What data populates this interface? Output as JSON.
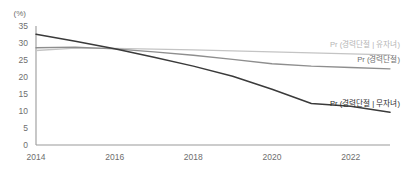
{
  "chart_data": {
    "type": "line",
    "title": "",
    "subtitle": "",
    "xlabel": "",
    "ylabel": "",
    "unit_label": "(%)",
    "grid": false,
    "legend_position": "inline-right-of-line-ends",
    "xlim": [
      2014,
      2023
    ],
    "ylim": [
      0,
      35
    ],
    "yticks": [
      "0",
      "5",
      "10",
      "15",
      "20",
      "25",
      "30",
      "35"
    ],
    "ytick_values": [
      0,
      5,
      10,
      15,
      20,
      25,
      30,
      35
    ],
    "xticks": [
      "2014",
      "2016",
      "2018",
      "2020",
      "2022"
    ],
    "xtick_values": [
      2014,
      2016,
      2018,
      2020,
      2022
    ],
    "x": [
      2014,
      2015,
      2016,
      2017,
      2018,
      2019,
      2020,
      2021,
      2022,
      2023
    ],
    "series": [
      {
        "name": "Pr (경력단절 | 유자녀)",
        "color": "#c4c4c4",
        "label_color": "#b4b4b4",
        "values": [
          27.8,
          28.5,
          28.4,
          28.2,
          28.0,
          27.7,
          27.4,
          27.1,
          26.8,
          26.5
        ]
      },
      {
        "name": "Pr (경력단절)",
        "color": "#8e8e8e",
        "label_color": "#6e6e6e",
        "values": [
          28.6,
          28.8,
          28.3,
          27.4,
          26.4,
          25.2,
          23.9,
          23.2,
          22.8,
          22.4
        ]
      },
      {
        "name": "Pr (경력단절 | 무자녀)",
        "color": "#3a3a3a",
        "label_color": "#2b2b2b",
        "values": [
          32.6,
          30.5,
          28.3,
          25.8,
          23.2,
          20.2,
          16.4,
          12.2,
          11.4,
          9.6
        ]
      }
    ]
  }
}
